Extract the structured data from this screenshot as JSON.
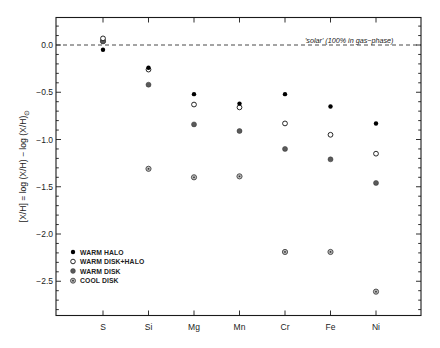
{
  "chart_data": {
    "type": "scatter",
    "title": "",
    "xlabel": "",
    "ylabel": "[X/H] = log (X/H) − log (X/H)",
    "ylabel_subscript": "⊙",
    "categories": [
      "S",
      "Si",
      "Mg",
      "Mn",
      "Cr",
      "Fe",
      "Ni"
    ],
    "ylim": [
      -2.87,
      0.3
    ],
    "yticks": [
      0.0,
      -0.5,
      -1.0,
      -1.5,
      -2.0,
      -2.5
    ],
    "ytick_labels": [
      "0.0",
      "−0.5",
      "−1.0",
      "−1.5",
      "−2.0",
      "−2.5"
    ],
    "minor_ytick_step": 0.1,
    "grid": false,
    "legend_position": "lower-left",
    "reference_line": {
      "y": 0.0,
      "style": "dashed",
      "label": "'solar' (100% in gas−phase)"
    },
    "series": [
      {
        "key": "cool_disk",
        "name": "COOL DISK",
        "marker": "dotted-circle",
        "color": "#444444",
        "values": [
          0.04,
          -1.31,
          -1.4,
          -1.39,
          -2.19,
          -2.19,
          -2.61
        ]
      },
      {
        "key": "warm_disk",
        "name": "WARM DISK",
        "marker": "gray-filled-circle",
        "color": "#5a5a5a",
        "values": [
          0.04,
          -0.42,
          -0.84,
          -0.91,
          -1.1,
          -1.21,
          -1.46
        ]
      },
      {
        "key": "warm_disk_halo",
        "name": "WARM DISK+HALO",
        "marker": "open-circle",
        "color": "#111111",
        "values": [
          0.07,
          -0.26,
          -0.63,
          -0.66,
          -0.83,
          -0.95,
          -1.15
        ]
      },
      {
        "key": "warm_halo",
        "name": "WARM HALO",
        "marker": "filled-circle",
        "color": "#000000",
        "values": [
          -0.05,
          -0.24,
          -0.52,
          -0.62,
          -0.52,
          -0.65,
          -0.83
        ]
      }
    ],
    "legend_order": [
      "warm_halo",
      "warm_disk_halo",
      "warm_disk",
      "cool_disk"
    ]
  },
  "legend": {
    "items": [
      {
        "label": "WARM HALO",
        "marker": "filled-circle"
      },
      {
        "label": "WARM DISK+HALO",
        "marker": "open-circle"
      },
      {
        "label": "WARM DISK",
        "marker": "gray-filled-circle"
      },
      {
        "label": "COOL DISK",
        "marker": "dotted-circle"
      }
    ]
  }
}
